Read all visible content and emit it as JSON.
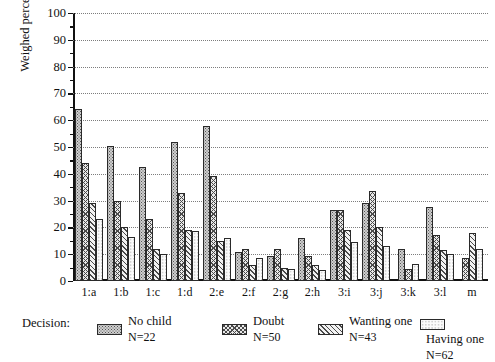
{
  "chart_data": {
    "type": "bar",
    "title": "",
    "xlabel": "",
    "ylabel": "Weighed percentage",
    "ylim": [
      0,
      100
    ],
    "ytick_step": 10,
    "yticks": [
      0,
      10,
      20,
      30,
      40,
      50,
      60,
      70,
      80,
      90,
      100
    ],
    "grid": true,
    "legend_position": "bottom",
    "legend_title": "Decision:",
    "categories": [
      "1:a",
      "1:b",
      "1:c",
      "1:d",
      "2:e",
      "2:f",
      "2:g",
      "2:h",
      "3:i",
      "3:j",
      "3:k",
      "3:l",
      "m"
    ],
    "series": [
      {
        "name": "No child",
        "n_label": "N=22",
        "pattern": "dense-dots",
        "values": [
          64,
          50.5,
          42.5,
          52,
          58,
          11,
          9.5,
          16,
          26.5,
          29,
          12,
          27.5,
          null
        ]
      },
      {
        "name": "Doubt",
        "n_label": "N=50",
        "pattern": "crosshatch",
        "values": [
          44,
          30,
          23,
          33,
          39,
          12,
          12,
          9.5,
          26.5,
          33.5,
          4.5,
          17,
          8.5
        ]
      },
      {
        "name": "Wanting one",
        "n_label": "N=43",
        "pattern": "diagonal-lines",
        "values": [
          29,
          20,
          12,
          19,
          15,
          6,
          5,
          6,
          19,
          20,
          null,
          11.5,
          18
        ]
      },
      {
        "name": "Having one",
        "n_label": "N=62",
        "pattern": "sparse-dots",
        "values": [
          23,
          16.5,
          10,
          18.5,
          16,
          8.5,
          4.5,
          4,
          14.5,
          13,
          6.5,
          10,
          12
        ]
      }
    ]
  },
  "legend": {
    "title": "Decision:",
    "items": [
      {
        "label": "No child",
        "n": "N=22",
        "pattern": "p-nochild"
      },
      {
        "label": "Doubt",
        "n": "N=50",
        "pattern": "p-doubt"
      },
      {
        "label": "Wanting one",
        "n": "N=43",
        "pattern": "p-wanting"
      },
      {
        "label": "Having one",
        "n": "N=62",
        "pattern": "p-having"
      }
    ]
  }
}
